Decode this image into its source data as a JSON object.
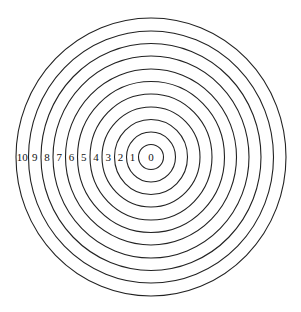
{
  "diagram": {
    "type": "concentric-circles",
    "center": {
      "x": 151,
      "y": 157
    },
    "ring_count": 11,
    "rings": [
      {
        "label": "0",
        "rx": 12.5,
        "ry": 12.5
      },
      {
        "label": "1",
        "rx": 24.5,
        "ry": 25
      },
      {
        "label": "2",
        "rx": 36.5,
        "ry": 37.5
      },
      {
        "label": "3",
        "rx": 49,
        "ry": 50
      },
      {
        "label": "4",
        "rx": 61,
        "ry": 63
      },
      {
        "label": "5",
        "rx": 73.5,
        "ry": 75.5
      },
      {
        "label": "6",
        "rx": 85.5,
        "ry": 88
      },
      {
        "label": "7",
        "rx": 98,
        "ry": 101
      },
      {
        "label": "8",
        "rx": 110,
        "ry": 113.5
      },
      {
        "label": "9",
        "rx": 122.5,
        "ry": 126
      },
      {
        "label": "10",
        "rx": 135,
        "ry": 139
      }
    ],
    "stroke_color": "#222222",
    "background": "#ffffff"
  }
}
